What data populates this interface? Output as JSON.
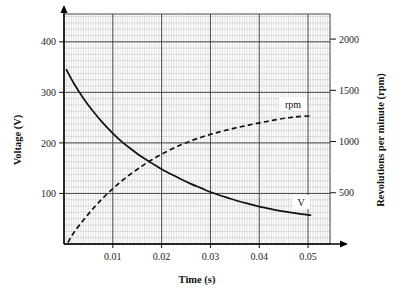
{
  "chart_data": {
    "type": "line",
    "title": "",
    "xlabel": "Time (s)",
    "ylabel": "Voltage (V)",
    "y2label": "Revolutions per minute (rpm)",
    "grid": true,
    "grid_minor": true,
    "legend_position": "inline-annotation",
    "xlim": [
      0,
      0.0545
    ],
    "ylim": [
      0,
      455
    ],
    "y2lim": [
      0,
      2245
    ],
    "xticks": [
      0.01,
      0.02,
      0.03,
      0.04,
      0.05
    ],
    "xticklabels": [
      "0.01",
      "0.02",
      "0.03",
      "0.04",
      "0.05"
    ],
    "yticks": [
      100,
      200,
      300,
      400
    ],
    "yticklabels": [
      "100",
      "200",
      "300",
      "400"
    ],
    "y2ticks": [
      500,
      1000,
      1500,
      2000
    ],
    "y2ticklabels": [
      "500",
      "1000",
      "1500",
      "2000"
    ],
    "annotations": [
      {
        "text": "rpm",
        "x": 0.0455,
        "y2": 1330
      },
      {
        "text": "V",
        "x": 0.0485,
        "y": 120
      }
    ],
    "series": [
      {
        "name": "V",
        "axis": "left",
        "style": "solid",
        "color": "#111111",
        "x": [
          0.0005,
          0.002,
          0.004,
          0.006,
          0.008,
          0.01,
          0.012,
          0.014,
          0.016,
          0.018,
          0.02,
          0.022,
          0.024,
          0.026,
          0.028,
          0.03,
          0.032,
          0.034,
          0.036,
          0.038,
          0.04,
          0.042,
          0.044,
          0.046,
          0.048,
          0.0505
        ],
        "values": [
          345,
          318,
          288,
          262,
          239,
          219,
          201,
          186,
          172,
          160,
          148,
          138,
          128,
          119,
          111,
          103,
          96,
          90,
          84,
          79,
          74,
          70,
          66,
          63,
          60,
          57
        ]
      },
      {
        "name": "rpm",
        "axis": "right",
        "style": "dashed",
        "color": "#111111",
        "x": [
          0.0008,
          0.002,
          0.004,
          0.006,
          0.008,
          0.01,
          0.012,
          0.014,
          0.016,
          0.018,
          0.02,
          0.022,
          0.024,
          0.026,
          0.028,
          0.03,
          0.032,
          0.034,
          0.036,
          0.038,
          0.04,
          0.042,
          0.044,
          0.046,
          0.048,
          0.0505
        ],
        "values": [
          15,
          110,
          235,
          348,
          450,
          540,
          622,
          695,
          762,
          822,
          876,
          925,
          968,
          1006,
          1040,
          1070,
          1096,
          1120,
          1142,
          1162,
          1182,
          1200,
          1218,
          1232,
          1243,
          1250
        ]
      }
    ]
  },
  "labels": {
    "x_axis_title": "Time (s)",
    "y_axis_title": "Voltage (V)",
    "y2_axis_title": "Revolutions per minute (rpm)",
    "curve_v": "V",
    "curve_rpm": "rpm"
  }
}
